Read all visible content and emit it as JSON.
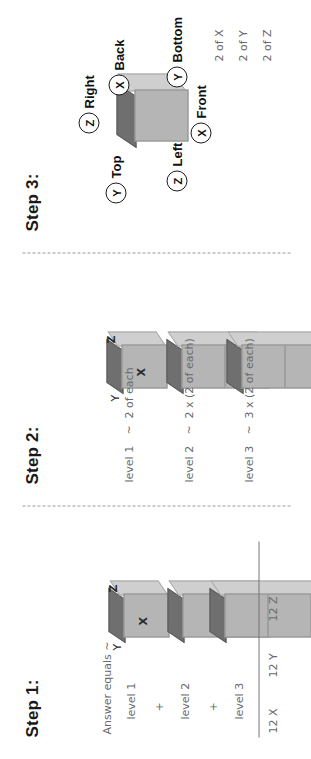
{
  "document": {
    "title": "Cube counting worksheet — Steps 1-3",
    "orientation": "rotated-90"
  },
  "steps": [
    {
      "id": "step1",
      "title": "Step 1:",
      "axis_labels": {
        "x": "X",
        "y": "Y",
        "z": "Z"
      },
      "notes": [
        "Answer equals ~",
        "level 1",
        "+",
        "level 2",
        "+",
        "level 3"
      ],
      "totals": [
        "12 X",
        "12 Y",
        "12 Z"
      ],
      "stack": [
        {
          "level": 1,
          "cubes": 1
        },
        {
          "level": 2,
          "cubes": 2
        },
        {
          "level": 3,
          "cubes": 3
        }
      ]
    },
    {
      "id": "step2",
      "title": "Step 2:",
      "axis_labels": {
        "x": "X",
        "y": "Y",
        "z": "Z"
      },
      "rows": [
        {
          "label": "level 1",
          "relation": "~",
          "expression": "2 of each"
        },
        {
          "label": "level 2",
          "relation": "~",
          "expression": "2 x (2 of each)"
        },
        {
          "label": "level 3",
          "relation": "~",
          "expression": "3 x (2 of each)"
        }
      ]
    },
    {
      "id": "step3",
      "title": "Step 3:",
      "callouts": [
        {
          "key": "Y",
          "label": "Top"
        },
        {
          "key": "Z",
          "label": "Right"
        },
        {
          "key": "X",
          "label": "Back"
        },
        {
          "key": "Z",
          "label": "Left"
        },
        {
          "key": "X",
          "label": "Front"
        },
        {
          "key": "Y",
          "label": "Bottom"
        }
      ],
      "summary": [
        "2 of X",
        "2 of Y",
        "2 of Z"
      ]
    }
  ],
  "colors": {
    "front_face": "#b5b5b5",
    "top_face": "#6f6f6f",
    "side_face": "#cfcfcf",
    "ink": "#6a6a6a",
    "heading": "#1a1a1a"
  }
}
